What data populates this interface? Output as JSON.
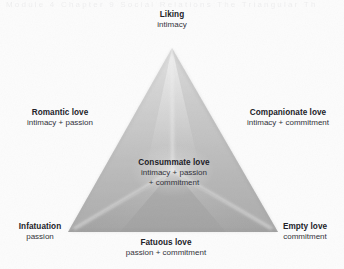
{
  "diagram": {
    "type": "triangular-theory-of-love",
    "shape": "triangle",
    "colors": {
      "background": "#fcfcfc",
      "fill_light": "#e6e6e6",
      "fill_mid": "#c4c4c4",
      "fill_dark": "#a2a2a2",
      "text": "#222228"
    },
    "vertices": {
      "apex": {
        "x": 172,
        "y": 48
      },
      "bottom_left": {
        "x": 68,
        "y": 232
      },
      "bottom_right": {
        "x": 278,
        "y": 232
      }
    },
    "scan_ghost_text": "Module 4   Chapter 9   Social   Relations   The Triangular Th"
  },
  "labels": {
    "liking": {
      "title": "Liking",
      "sub": "intimacy"
    },
    "romantic": {
      "title": "Romantic love",
      "sub": "intimacy + passion"
    },
    "companionate": {
      "title": "Companionate love",
      "sub": "intimacy + commitment"
    },
    "consummate": {
      "title": "Consummate love",
      "sub_line1": "intimacy + passion",
      "sub_line2": "+ commitment"
    },
    "infatuation": {
      "title": "Infatuation",
      "sub": "passion"
    },
    "fatuous": {
      "title": "Fatuous love",
      "sub": "passion + commitment"
    },
    "empty": {
      "title": "Empty love",
      "sub": "commitment"
    }
  }
}
